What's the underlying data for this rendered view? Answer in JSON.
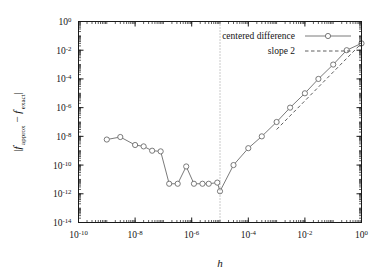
{
  "chart_data": {
    "type": "line",
    "title": "",
    "xlabel": "h",
    "ylabel": "|f'approx - f'exact|",
    "ylabel_parts": {
      "open": "|",
      "f1": "f",
      "prime1": "′",
      "sub1": "approx",
      "minus": "−",
      "f2": "f",
      "prime2": "′",
      "sub2": "exact",
      "close": "|"
    },
    "xscale": "log",
    "yscale": "log",
    "xlim": [
      1e-10,
      1
    ],
    "ylim": [
      1e-14,
      1
    ],
    "grid": false,
    "xticks": [
      1e-10,
      1e-08,
      1e-06,
      0.0001,
      0.01,
      1
    ],
    "xtick_labels": [
      "10^-10",
      "10^-8",
      "10^-6",
      "10^-4",
      "10^-2",
      "10^0"
    ],
    "xtick_exponents": [
      "-10",
      "-8",
      "-6",
      "-4",
      "-2",
      "0"
    ],
    "yticks": [
      1,
      0.01,
      0.0001,
      1e-06,
      1e-08,
      1e-10,
      1e-12,
      1e-14
    ],
    "ytick_labels": [
      "10^0",
      "10^-2",
      "10^-4",
      "10^-6",
      "10^-8",
      "10^-10",
      "10^-12",
      "10^-14"
    ],
    "ytick_exponents": [
      "0",
      "-2",
      "-4",
      "-6",
      "-8",
      "-10",
      "-12",
      "-14"
    ],
    "legend_position": "top-right",
    "series": [
      {
        "name": "centered difference",
        "style": "solid-with-markers",
        "color": "#6b6b6b",
        "marker": "open-circle",
        "x": [
          1e-09,
          3e-09,
          1e-08,
          2e-08,
          4e-08,
          8e-08,
          1.6e-07,
          3.2e-07,
          6.4e-07,
          1.2e-06,
          2.4e-06,
          4e-06,
          8e-06,
          1e-05,
          3e-05,
          0.0001,
          0.0003,
          0.001,
          0.003,
          0.01,
          0.03,
          0.1,
          0.3,
          1.0
        ],
        "y": [
          6e-09,
          9e-09,
          2.5e-09,
          2e-09,
          1e-09,
          9e-10,
          5e-12,
          5e-12,
          8e-11,
          5e-12,
          5e-12,
          5e-12,
          6e-12,
          1.5e-12,
          1e-10,
          1.5e-09,
          1e-08,
          1e-07,
          1e-06,
          1e-05,
          0.0001,
          0.001,
          0.01,
          0.03
        ]
      },
      {
        "name": "slope 2",
        "style": "dashed",
        "color": "#4d4d4d",
        "marker": "none",
        "x": [
          0.001,
          1.0
        ],
        "y": [
          3e-08,
          0.03
        ]
      }
    ],
    "annotations": [
      {
        "name": "optimal-h-marker",
        "type": "vertical-dotted-line",
        "x": 1e-05,
        "color": "#8a8a8a"
      }
    ]
  },
  "legend": {
    "entries": [
      {
        "label": "centered difference",
        "style": "solid-marker"
      },
      {
        "label": "slope 2",
        "style": "dashed"
      }
    ]
  }
}
